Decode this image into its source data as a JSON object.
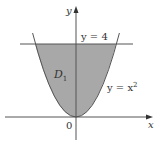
{
  "figure": {
    "axes": {
      "x_label": "x",
      "y_label": "y",
      "origin_label": "0"
    },
    "curves": [
      {
        "name": "parabola",
        "label_main": "y = x",
        "label_exp": "2"
      },
      {
        "name": "horizontal-line",
        "label": "y = 4"
      }
    ],
    "region": {
      "label_main": "D",
      "label_sub": "1",
      "fill": "#a8a8a8"
    },
    "colors": {
      "line": "#555555",
      "region": "#a8a8a8",
      "background": "#ffffff"
    }
  }
}
